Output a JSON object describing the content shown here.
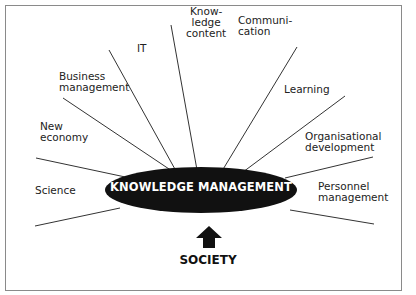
{
  "diagram": {
    "center_label": "KNOWLEDGE MANAGEMENT",
    "base_label": "SOCIETY",
    "spokes": [
      {
        "label": "Science"
      },
      {
        "label": "New\neconomy"
      },
      {
        "label": "Business\nmanagement"
      },
      {
        "label": "IT"
      },
      {
        "label": "Know-\nledge\ncontent"
      },
      {
        "label": "Communi-\ncation"
      },
      {
        "label": "Learning"
      },
      {
        "label": "Organisational\ndevelopment"
      },
      {
        "label": "Personnel\nmanagement"
      }
    ],
    "colors": {
      "ellipse": "#111111",
      "lines": "#333333",
      "border": "#888888"
    }
  }
}
